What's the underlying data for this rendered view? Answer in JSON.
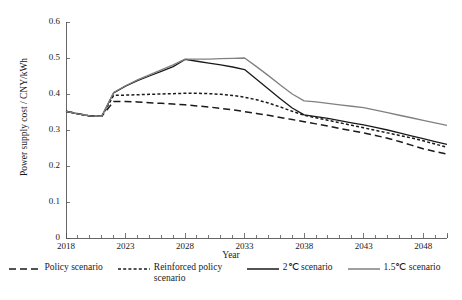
{
  "chart_data": {
    "type": "line",
    "title": "",
    "xlabel": "Year",
    "ylabel": "Power supply cost / CNY/kWh",
    "xlim": [
      2018,
      2050
    ],
    "ylim": [
      0,
      0.6
    ],
    "xticks": [
      2018,
      2023,
      2028,
      2033,
      2038,
      2043,
      2048
    ],
    "xtick_labels": [
      "2018",
      "2023",
      "2028",
      "2033",
      "2038",
      "2043",
      "2048"
    ],
    "xtick_minor_step": 1,
    "yticks": [
      0,
      0.1,
      0.2,
      0.3,
      0.4,
      0.5,
      0.6
    ],
    "ytick_labels": [
      "0",
      "0.1",
      "0.2",
      "0.3",
      "0.4",
      "0.5",
      "0.6"
    ],
    "grid": false,
    "legend_position": "bottom",
    "x": [
      2018,
      2019,
      2020,
      2021,
      2022,
      2023,
      2024,
      2025,
      2026,
      2027,
      2028,
      2029,
      2030,
      2031,
      2032,
      2033,
      2034,
      2035,
      2036,
      2037,
      2038,
      2039,
      2040,
      2041,
      2042,
      2043,
      2044,
      2045,
      2046,
      2047,
      2048,
      2049,
      2050
    ],
    "series": [
      {
        "name": "Policy scenario",
        "style": "dashed",
        "color": "#1a1a1a",
        "values": [
          0.352,
          0.345,
          0.339,
          0.338,
          0.379,
          0.379,
          0.378,
          0.376,
          0.374,
          0.372,
          0.37,
          0.367,
          0.364,
          0.36,
          0.356,
          0.351,
          0.346,
          0.341,
          0.335,
          0.329,
          0.323,
          0.317,
          0.311,
          0.304,
          0.298,
          0.292,
          0.285,
          0.277,
          0.268,
          0.258,
          0.248,
          0.24,
          0.233
        ]
      },
      {
        "name": "Reinforced policy scenario",
        "style": "dotted",
        "color": "#1a1a1a",
        "values": [
          0.352,
          0.345,
          0.339,
          0.338,
          0.396,
          0.397,
          0.398,
          0.399,
          0.4,
          0.401,
          0.402,
          0.402,
          0.401,
          0.399,
          0.396,
          0.391,
          0.384,
          0.375,
          0.364,
          0.352,
          0.341,
          0.334,
          0.327,
          0.32,
          0.313,
          0.306,
          0.299,
          0.292,
          0.285,
          0.278,
          0.27,
          0.261,
          0.252
        ]
      },
      {
        "name": "2℃ scenario",
        "style": "solid",
        "color": "#1a1a1a",
        "values": [
          0.352,
          0.345,
          0.339,
          0.338,
          0.403,
          0.422,
          0.437,
          0.45,
          0.463,
          0.476,
          0.496,
          0.491,
          0.486,
          0.481,
          0.475,
          0.468,
          0.441,
          0.414,
          0.387,
          0.361,
          0.342,
          0.337,
          0.332,
          0.326,
          0.32,
          0.314,
          0.307,
          0.3,
          0.292,
          0.284,
          0.276,
          0.268,
          0.26
        ]
      },
      {
        "name": "1.5℃ scenario",
        "style": "solid",
        "color": "#808080",
        "values": [
          0.352,
          0.345,
          0.339,
          0.338,
          0.404,
          0.423,
          0.439,
          0.453,
          0.467,
          0.481,
          0.497,
          0.497,
          0.497,
          0.498,
          0.499,
          0.5,
          0.476,
          0.451,
          0.425,
          0.4,
          0.381,
          0.378,
          0.374,
          0.37,
          0.366,
          0.362,
          0.355,
          0.348,
          0.341,
          0.334,
          0.327,
          0.32,
          0.313
        ]
      }
    ]
  },
  "legend": {
    "entries": [
      {
        "label": "Policy scenario",
        "style": "dashed",
        "color": "#1a1a1a"
      },
      {
        "label": "Reinforced policy scenario",
        "style": "dotted",
        "color": "#1a1a1a"
      },
      {
        "label": "2℃ scenario",
        "style": "solid",
        "color": "#1a1a1a"
      },
      {
        "label": "1.5℃ scenario",
        "style": "solid",
        "color": "#808080"
      }
    ]
  }
}
